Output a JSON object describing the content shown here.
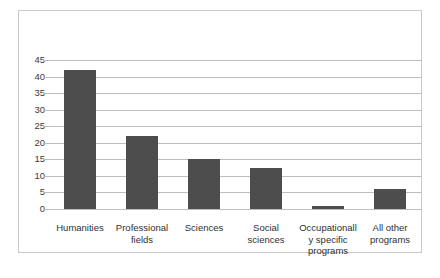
{
  "chart_data": {
    "type": "bar",
    "title": "",
    "subtitle": "",
    "xlabel": "",
    "ylabel": "",
    "ylim": [
      0,
      45
    ],
    "ytick_step": 5,
    "yticks": [
      45,
      40,
      35,
      30,
      25,
      20,
      15,
      10,
      5,
      0
    ],
    "grid": true,
    "legend": false,
    "legend_position": "none",
    "orientation": "vertical",
    "categories": [
      "Humanities",
      "Professional fields",
      "Sciences",
      "Social sciences",
      "Occupationally specific programs",
      "All other programs"
    ],
    "values": [
      42,
      22,
      15,
      12.5,
      1,
      6
    ],
    "bar_color": "#4d4d4d",
    "gridline_color": "#bdbdbd",
    "frame_color": "#c9c9c9",
    "background_color": "#ffffff",
    "text_color": "#2f2f2f"
  }
}
